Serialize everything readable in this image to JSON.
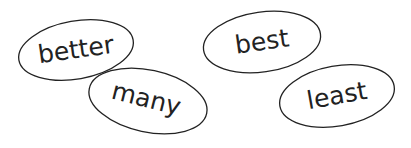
{
  "words": [
    {
      "text": "better",
      "cx": 76,
      "cy": 50,
      "rx": 58,
      "ry": 29,
      "rot": -10,
      "trot": -8
    },
    {
      "text": "many",
      "cx": 148,
      "cy": 101,
      "rx": 60,
      "ry": 31,
      "rot": 12,
      "trot": 14
    },
    {
      "text": "best",
      "cx": 262,
      "cy": 42,
      "rx": 59,
      "ry": 30,
      "rot": -8,
      "trot": -8
    },
    {
      "text": "least",
      "cx": 337,
      "cy": 96,
      "rx": 58,
      "ry": 30,
      "rot": -10,
      "trot": -10
    }
  ],
  "colors": {
    "ink": "#222222",
    "background": "#ffffff"
  }
}
